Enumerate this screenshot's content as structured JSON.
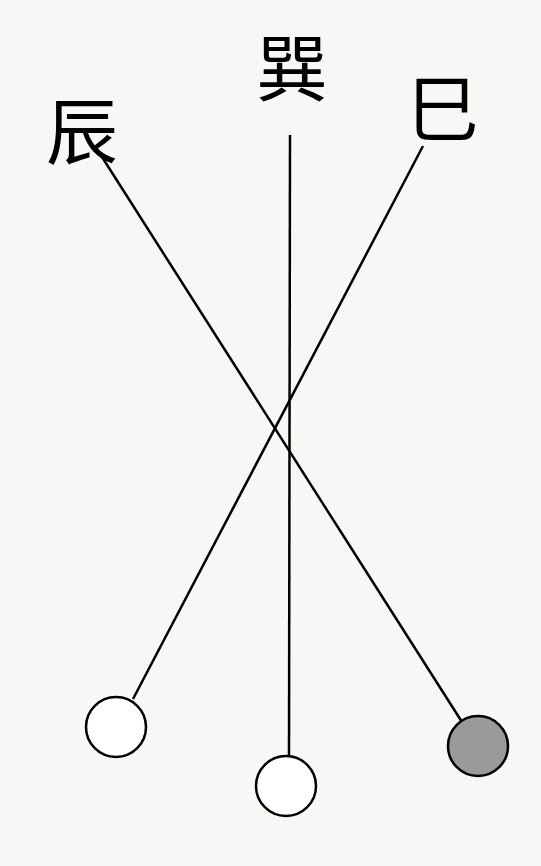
{
  "labels": [
    {
      "text": "辰",
      "x": 82,
      "y": 158
    },
    {
      "text": "巽",
      "x": 292,
      "y": 95
    },
    {
      "text": "巳",
      "x": 443,
      "y": 135
    }
  ],
  "lines": [
    {
      "from": "辰",
      "x1": 95,
      "y1": 146,
      "x2": 462,
      "y2": 722
    },
    {
      "from": "巽",
      "x1": 290,
      "y1": 135,
      "x2": 289,
      "y2": 757
    },
    {
      "from": "巳",
      "x1": 423,
      "y1": 146,
      "x2": 133,
      "y2": 699
    }
  ],
  "circles": [
    {
      "cx": 116,
      "cy": 727,
      "r": 30,
      "fill": "#ffffff"
    },
    {
      "cx": 286,
      "cy": 786,
      "r": 30,
      "fill": "#ffffff"
    },
    {
      "cx": 478,
      "cy": 746,
      "r": 30,
      "fill": "#9a9a9a"
    }
  ],
  "colors": {
    "stroke": "#000000",
    "background": "#f7f7f5"
  }
}
